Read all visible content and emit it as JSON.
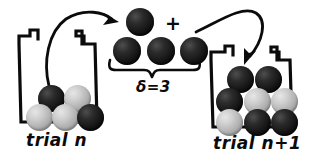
{
  "figure": {
    "type": "diagram",
    "ink_color": "#0b0b0b",
    "background_color": "#ffffff"
  },
  "left_urn": {
    "label": "trial  n",
    "ball_count": 5,
    "balls": [
      {
        "shade": "dark",
        "x": 38,
        "y": 85,
        "d": 27
      },
      {
        "shade": "light",
        "x": 64,
        "y": 85,
        "d": 27
      },
      {
        "shade": "light",
        "x": 26,
        "y": 104,
        "d": 27
      },
      {
        "shade": "light",
        "x": 52,
        "y": 104,
        "d": 27
      },
      {
        "shade": "dark",
        "x": 77,
        "y": 104,
        "d": 27
      }
    ]
  },
  "center_group": {
    "plus_symbol": "+",
    "delta_label": "δ=3",
    "single_ball": {
      "shade": "dark",
      "x": 126,
      "y": 8,
      "d": 28
    },
    "row_balls": [
      {
        "shade": "dark",
        "x": 113,
        "y": 37,
        "d": 28
      },
      {
        "shade": "dark",
        "x": 147,
        "y": 37,
        "d": 28
      },
      {
        "shade": "dark",
        "x": 180,
        "y": 37,
        "d": 28
      }
    ]
  },
  "right_urn": {
    "label": "trial  n+1",
    "ball_count": 8,
    "balls": [
      {
        "shade": "dark",
        "x": 227,
        "y": 66,
        "d": 27
      },
      {
        "shade": "dark",
        "x": 255,
        "y": 66,
        "d": 27
      },
      {
        "shade": "dark",
        "x": 216,
        "y": 88,
        "d": 27
      },
      {
        "shade": "light",
        "x": 244,
        "y": 88,
        "d": 27
      },
      {
        "shade": "light",
        "x": 271,
        "y": 88,
        "d": 27
      },
      {
        "shade": "light",
        "x": 216,
        "y": 109,
        "d": 27
      },
      {
        "shade": "dark",
        "x": 244,
        "y": 109,
        "d": 27
      },
      {
        "shade": "dark",
        "x": 271,
        "y": 109,
        "d": 27
      }
    ]
  },
  "arrows": {
    "draw_out": "curved arrow from left urn up to the single ball",
    "put_in": "curved arrow from center group down into right urn"
  }
}
